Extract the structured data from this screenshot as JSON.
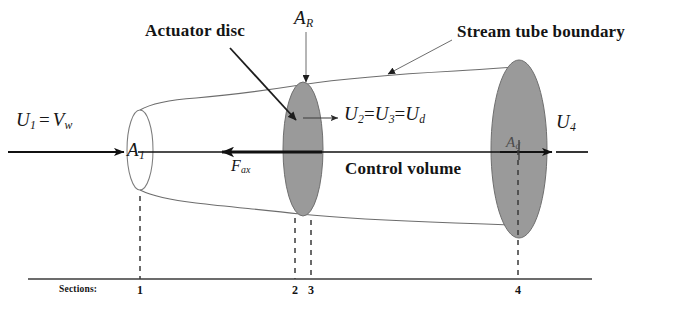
{
  "figure": {
    "title_alt": "Actuator disc stream tube control volume",
    "colors": {
      "disc_fill": "#9a9a9a",
      "disc_stroke": "#6f6f6f",
      "line": "#1a1a1a",
      "thin_line": "#5a5a5a",
      "background": "#ffffff"
    }
  },
  "labels": {
    "actuator_disc": "Actuator disc",
    "stream_tube_boundary": "Stream tube boundary",
    "control_volume": "Control volume",
    "area_rotor": "A",
    "area_rotor_sub": "R",
    "area_inlet": "A",
    "area_inlet_sub": "1",
    "area_downstream": "A",
    "area_downstream_sub": "d",
    "force_axial": "F",
    "force_axial_sub": "ax",
    "inlet_velocity": "U",
    "inlet_velocity_sub": "1",
    "inlet_velocity_eq": "=",
    "wind_velocity": "V",
    "wind_velocity_sub": "w",
    "disc_velocity_u2": "U",
    "disc_velocity_u2_sub": "2",
    "disc_velocity_eq1": "=",
    "disc_velocity_u3": "U",
    "disc_velocity_u3_sub": "3",
    "disc_velocity_eq2": "=",
    "disc_velocity_ud": "U",
    "disc_velocity_ud_sub": "d",
    "exit_velocity": "U",
    "exit_velocity_sub": "4"
  },
  "sections": {
    "caption": "Sections:",
    "marks": [
      {
        "label": "1",
        "x": 140
      },
      {
        "label": "2",
        "x": 295
      },
      {
        "label": "3",
        "x": 311
      },
      {
        "label": "4",
        "x": 518
      }
    ]
  }
}
